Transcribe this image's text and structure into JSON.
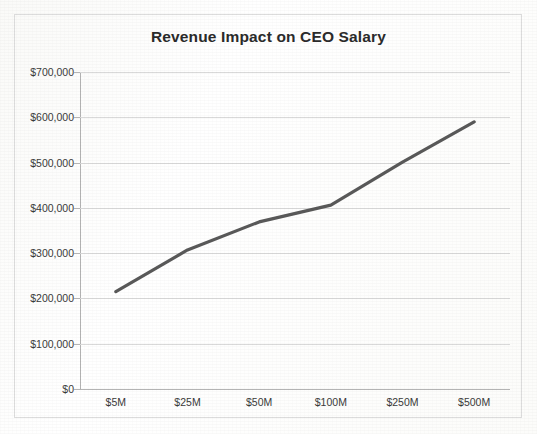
{
  "chart_data": {
    "type": "line",
    "title": "Revenue Impact on CEO Salary",
    "xlabel": "",
    "ylabel": "",
    "categories": [
      "$5M",
      "$25M",
      "$50M",
      "$100M",
      "$250M",
      "$500M"
    ],
    "values": [
      215000,
      307000,
      369000,
      406000,
      501000,
      590000
    ],
    "series": [
      {
        "name": "CEO Salary",
        "values": [
          215000,
          307000,
          369000,
          406000,
          501000,
          590000
        ]
      }
    ],
    "ylim": [
      0,
      700000
    ],
    "ytick_values": [
      0,
      100000,
      200000,
      300000,
      400000,
      500000,
      600000,
      700000
    ],
    "ytick_labels": [
      "$0",
      "$100,000",
      "$200,000",
      "$300,000",
      "$400,000",
      "$500,000",
      "$600,000",
      "$700,000"
    ],
    "grid": true,
    "legend": false,
    "legend_position": "none",
    "line_color": "#595959",
    "grid_color": "#d9d9d9",
    "axis_color": "#b4b4b4",
    "background_color": "#ffffff",
    "text_color": "#3a3a3a"
  },
  "frame": {
    "border_color": "#dcdcdc"
  }
}
